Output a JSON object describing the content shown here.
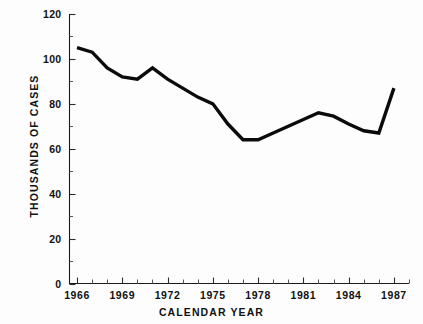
{
  "chart_data": {
    "type": "line",
    "title": "",
    "subtitle": "",
    "xlabel": "CALENDAR YEAR",
    "ylabel": "THOUSANDS OF CASES",
    "xlim": [
      1965.5,
      1988
    ],
    "ylim": [
      0,
      120
    ],
    "grid": false,
    "legend": null,
    "x_tick_labels": [
      "1966",
      "1969",
      "1972",
      "1975",
      "1978",
      "1981",
      "1984",
      "1987"
    ],
    "x_tick_values": [
      1966,
      1969,
      1972,
      1975,
      1978,
      1981,
      1984,
      1987
    ],
    "x_minor_tick_values": [
      1967,
      1968,
      1970,
      1971,
      1973,
      1974,
      1976,
      1977,
      1979,
      1980,
      1982,
      1983,
      1985,
      1986,
      1988
    ],
    "y_tick_labels": [
      "0",
      "20",
      "40",
      "60",
      "80",
      "100",
      "120"
    ],
    "y_tick_values": [
      0,
      20,
      40,
      60,
      80,
      100,
      120
    ],
    "y_minor_tick_values": [
      10,
      30,
      50,
      70,
      90,
      110
    ],
    "x": [
      1966,
      1967,
      1968,
      1969,
      1970,
      1971,
      1972,
      1973,
      1974,
      1975,
      1976,
      1977,
      1978,
      1979,
      1980,
      1981,
      1982,
      1983,
      1984,
      1985,
      1986,
      1987
    ],
    "values": [
      105,
      103,
      96,
      92,
      91,
      96,
      91,
      87,
      83,
      80,
      71,
      64,
      64,
      67,
      70,
      73,
      76,
      74.5,
      71,
      68,
      67,
      87
    ],
    "series": [
      {
        "name": "Cases",
        "color": "#0b0b0b",
        "values": [
          105,
          103,
          96,
          92,
          91,
          96,
          91,
          87,
          83,
          80,
          71,
          64,
          64,
          67,
          70,
          73,
          76,
          74.5,
          71,
          68,
          67,
          87
        ]
      }
    ],
    "annotations": []
  },
  "axes": {
    "y_axis_name": "y-axis",
    "x_axis_name": "x-axis"
  }
}
